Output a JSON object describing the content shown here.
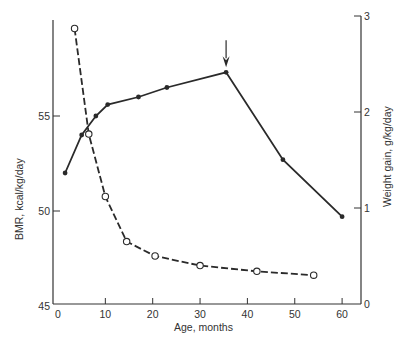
{
  "chart_data": {
    "type": "line",
    "title": "",
    "xlabel": "Age, months",
    "ylabel_left": "BMR, kcal/kg/day",
    "ylabel_right": "Weight gain, g/kg/day",
    "xlim": [
      0,
      62
    ],
    "ylim_left": [
      45,
      60
    ],
    "ylim_right": [
      0,
      3
    ],
    "x_ticks": [
      0,
      10,
      20,
      30,
      40,
      50,
      60
    ],
    "y_ticks_left": [
      45,
      50,
      55
    ],
    "y_ticks_right": [
      0,
      1,
      2,
      3
    ],
    "grid": false,
    "legend": "none",
    "series": [
      {
        "name": "BMR, kcal/kg/day",
        "axis": "left",
        "style": "solid line, filled circles",
        "x": [
          1.5,
          5,
          8,
          10.5,
          17,
          23,
          35.5,
          47.5,
          60
        ],
        "y": [
          52.0,
          54.0,
          55.0,
          55.6,
          56.0,
          56.5,
          57.3,
          52.7,
          49.7
        ]
      },
      {
        "name": "Weight gain, g/kg/day",
        "axis": "right",
        "style": "dashed line, open circles",
        "x": [
          3.5,
          6.5,
          10,
          14.5,
          20.5,
          30,
          42,
          54
        ],
        "y": [
          2.87,
          1.77,
          1.12,
          0.65,
          0.5,
          0.4,
          0.34,
          0.3
        ]
      }
    ],
    "annotations": [
      {
        "type": "arrow",
        "pointing": "down",
        "at_x": 35.5,
        "label": "",
        "note": "marks BMR peak at ~36 months"
      }
    ]
  },
  "labels": {
    "x_title": "Age, months",
    "y_left_title": "BMR, kcal/kg/day",
    "y_right_title": "Weight gain, g/kg/day",
    "x_ticks": [
      "0",
      "10",
      "20",
      "30",
      "40",
      "50",
      "60"
    ],
    "y_left_ticks": [
      "45",
      "50",
      "55"
    ],
    "y_right_ticks": [
      "0",
      "1",
      "2",
      "3"
    ]
  }
}
